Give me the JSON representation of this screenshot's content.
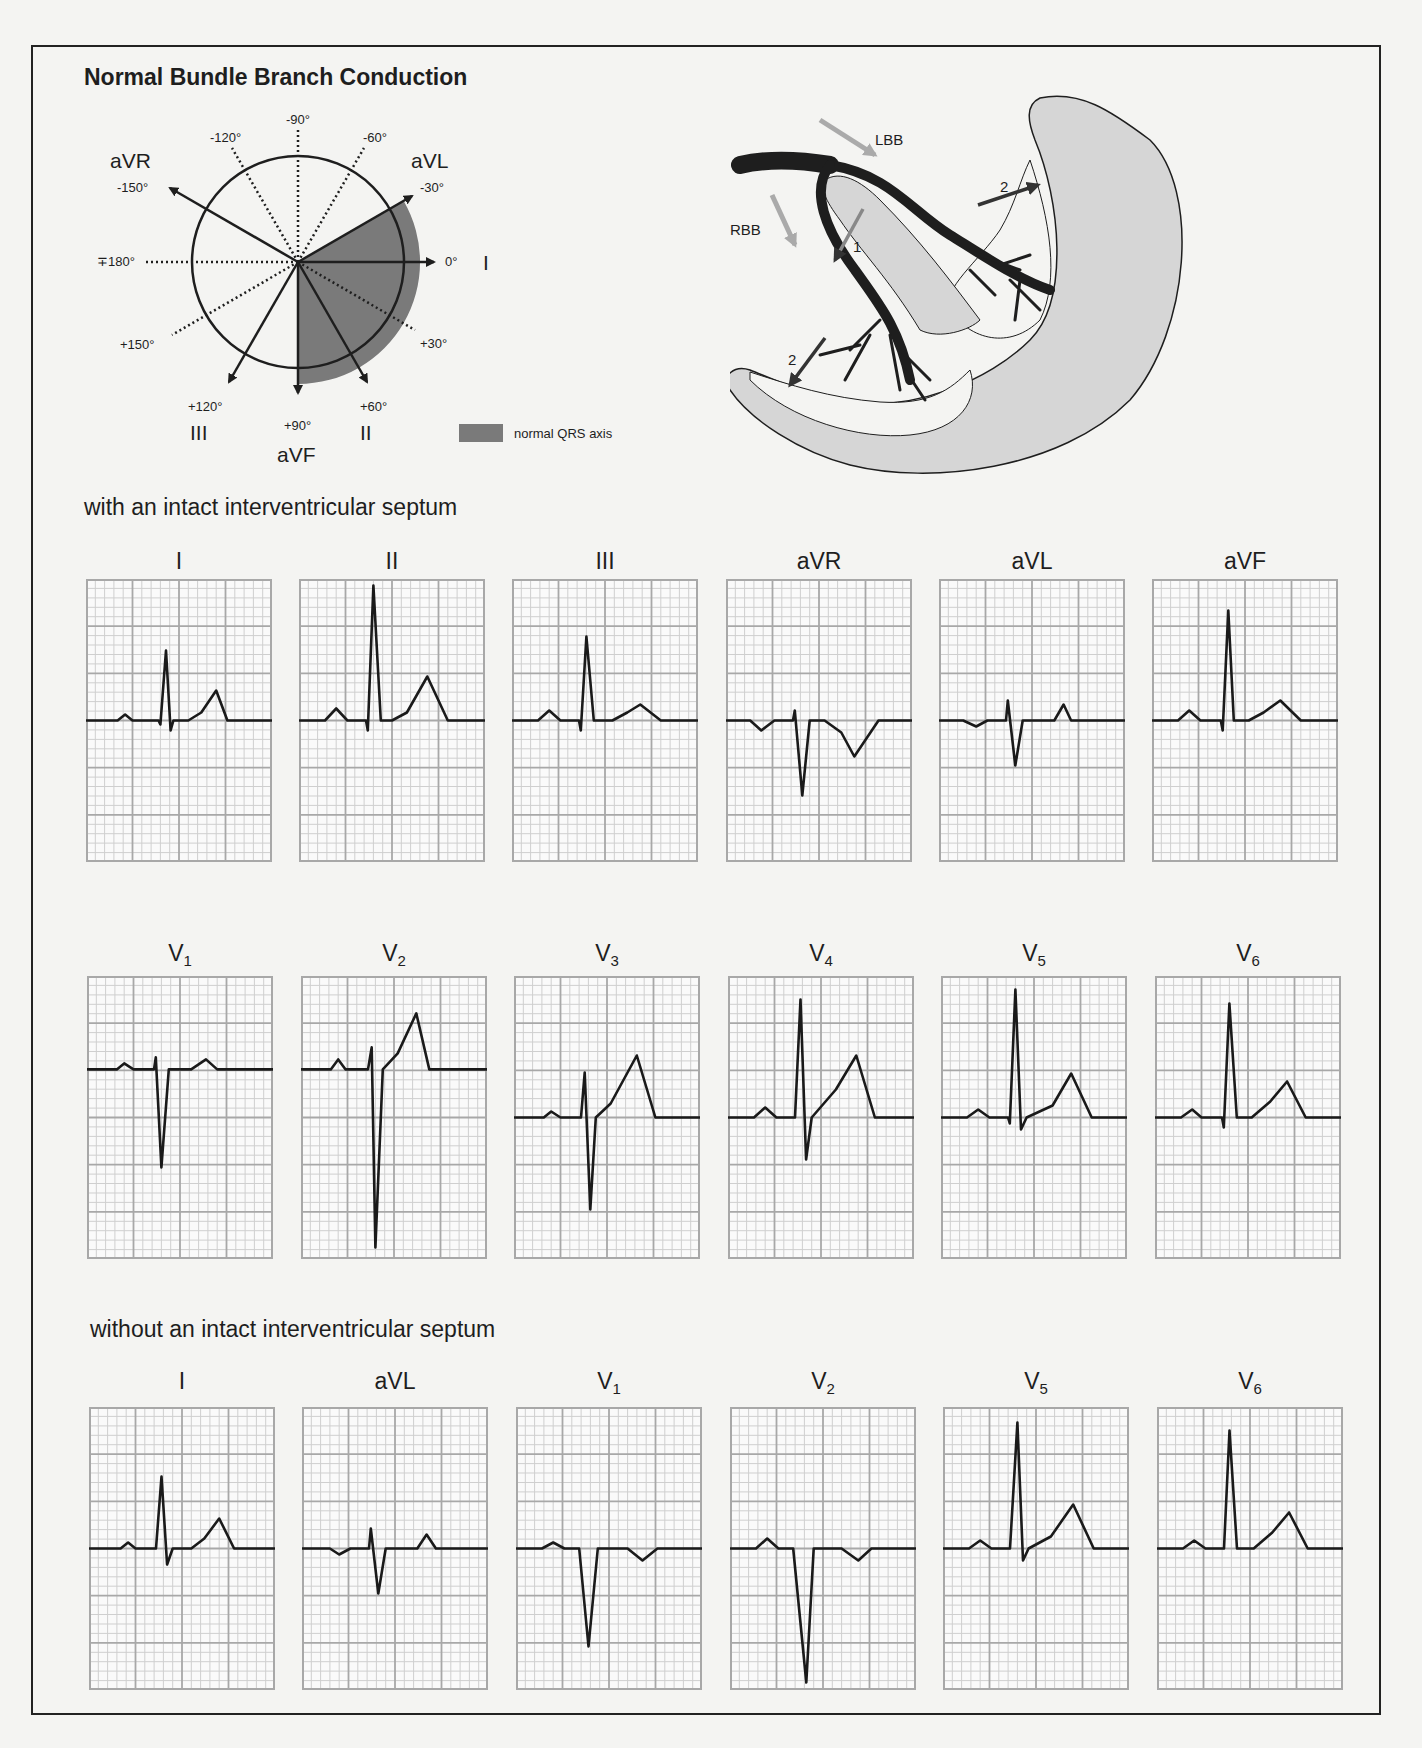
{
  "title": "Normal Bundle Branch Conduction",
  "axis_diagram": {
    "degree_labels": {
      "m90": "-90°",
      "m120": "-120°",
      "m60": "-60°",
      "m150": "-150°",
      "m30": "-30°",
      "p180": "∓180°",
      "zero": "0°",
      "p150": "+150°",
      "p30": "+30°",
      "p120": "+120°",
      "p90": "+90°",
      "p60": "+60°"
    },
    "lead_labels": {
      "aVR": "aVR",
      "aVL": "aVL",
      "I": "I",
      "III": "III",
      "aVF": "aVF",
      "II": "II"
    },
    "legend": {
      "label": "normal QRS axis",
      "color": "#7a7a7a"
    }
  },
  "heart_diagram": {
    "labels": {
      "lbb": "LBB",
      "rbb": "RBB",
      "step1": "1",
      "step2_left": "2",
      "step2_right": "2"
    },
    "colors": {
      "myocardium": "#d6d6d6",
      "conduction": "#1e1e1e",
      "arrow_light": "#aaaaaa",
      "arrow_dark": "#333333"
    }
  },
  "sections": [
    {
      "title": "with an intact interventricular septum",
      "rows": [
        [
          {
            "lead": "I",
            "sub": ""
          },
          {
            "lead": "II",
            "sub": ""
          },
          {
            "lead": "III",
            "sub": ""
          },
          {
            "lead": "aVR",
            "sub": ""
          },
          {
            "lead": "aVL",
            "sub": ""
          },
          {
            "lead": "aVF",
            "sub": ""
          }
        ],
        [
          {
            "lead": "V",
            "sub": "1"
          },
          {
            "lead": "V",
            "sub": "2"
          },
          {
            "lead": "V",
            "sub": "3"
          },
          {
            "lead": "V",
            "sub": "4"
          },
          {
            "lead": "V",
            "sub": "5"
          },
          {
            "lead": "V",
            "sub": "6"
          }
        ]
      ]
    },
    {
      "title": "without an intact interventricular septum",
      "rows": [
        [
          {
            "lead": "I",
            "sub": ""
          },
          {
            "lead": "aVL",
            "sub": ""
          },
          {
            "lead": "V",
            "sub": "1"
          },
          {
            "lead": "V",
            "sub": "2"
          },
          {
            "lead": "V",
            "sub": "5"
          },
          {
            "lead": "V",
            "sub": "6"
          }
        ]
      ]
    }
  ],
  "ecg_grid": {
    "large_cols": 4,
    "large_rows": 6,
    "small_per_large": 5,
    "major_color": "#a8a8a8",
    "minor_color": "#cfcfcf",
    "trace_color": "#1a1a1a"
  }
}
